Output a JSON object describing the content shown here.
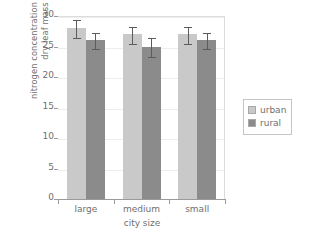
{
  "chart_data": {
    "type": "bar",
    "title": "",
    "categories": [
      "large",
      "medium",
      "small"
    ],
    "series": [
      {
        "name": "urban",
        "color": "#c9c9c9",
        "values": [
          28.0,
          27.0,
          27.0
        ],
        "errors": [
          1.5,
          1.4,
          1.4
        ]
      },
      {
        "name": "rural",
        "color": "#8b8b8b",
        "values": [
          26.0,
          25.0,
          26.0
        ],
        "errors": [
          1.3,
          1.5,
          1.3
        ]
      }
    ],
    "xlabel": "city size",
    "ylabel_line1": "nitrogen concentration / mg g",
    "ylabel_superscript": "−1",
    "ylabel_line2": "dry leaf mass",
    "ylim": [
      0,
      30
    ],
    "yticks": [
      0,
      5,
      10,
      15,
      20,
      25,
      30
    ],
    "ytick_labels": [
      "0",
      "5",
      "10",
      "15",
      "20",
      "25",
      "30"
    ],
    "grid": true,
    "legend_position": "right"
  },
  "legend": {
    "items": [
      {
        "label": "urban",
        "swatch_color": "#c9c9c9"
      },
      {
        "label": "rural",
        "swatch_color": "#8b8b8b"
      }
    ]
  },
  "axes": {
    "x_title": "city size",
    "x_tick_labels": [
      "large",
      "medium",
      "small"
    ],
    "y_tick_labels": [
      "0",
      "5",
      "10",
      "15",
      "20",
      "25",
      "30"
    ]
  }
}
